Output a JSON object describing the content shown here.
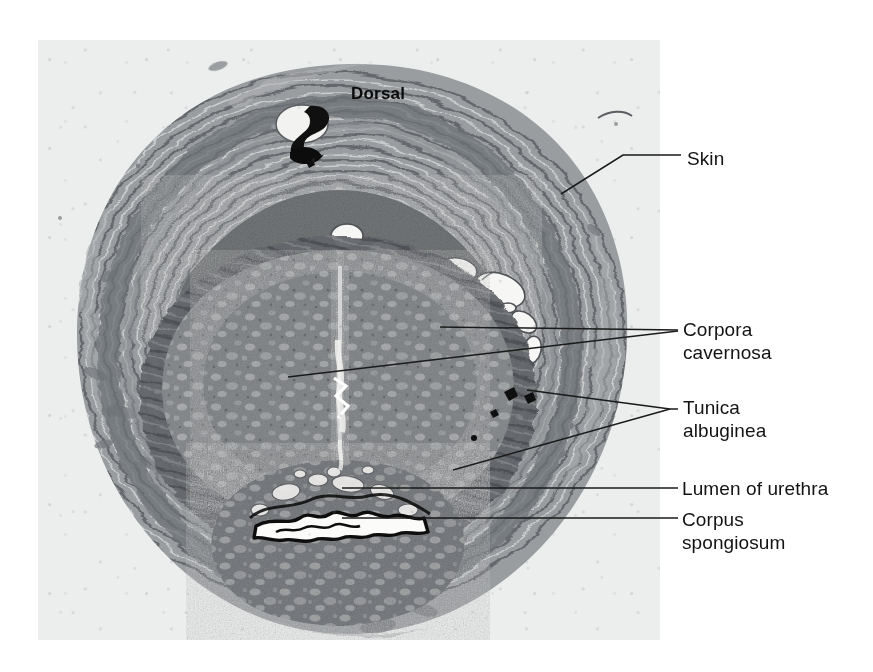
{
  "figure": {
    "kind": "light-micrograph",
    "panel_background": "#eceded"
  },
  "orientation": {
    "top_label": "Dorsal",
    "bottom_label": "Ventral"
  },
  "labels": [
    {
      "id": "skin",
      "text": "Skin",
      "leader": "bent",
      "points_to": "outer integument / dermis at upper right of section"
    },
    {
      "id": "corpora-cavernosa",
      "text": "Corpora\ncavernosa",
      "leader": "double",
      "points_to": "paired erectile bodies in the dorsal half of the section"
    },
    {
      "id": "tunica-albuginea",
      "text": "Tunica\nalbuginea",
      "leader": "forked",
      "points_to": "dense collagenous sheath enclosing the erectile bodies"
    },
    {
      "id": "lumen-of-urethra",
      "text": "Lumen of urethra",
      "leader": "straight",
      "points_to": "irregular slit-like channel within the corpus spongiosum"
    },
    {
      "id": "corpus-spongiosum",
      "text": "Corpus\nspongiosum",
      "leader": "straight",
      "points_to": "ventral erectile body surrounding the urethra"
    }
  ],
  "tissue_regions": [
    {
      "name": "skin-and-dartos",
      "tone": "#8e9194"
    },
    {
      "name": "deep-fascia",
      "tone": "#7c7f83"
    },
    {
      "name": "dorsal-neurovascular-bundle",
      "tone": "#6f7276"
    },
    {
      "name": "corpus-cavernosum-left",
      "tone": "#828588"
    },
    {
      "name": "corpus-cavernosum-right",
      "tone": "#828588"
    },
    {
      "name": "tunica-albuginea-sheath",
      "tone": "#5f6266"
    },
    {
      "name": "corpus-spongiosum",
      "tone": "#74777b"
    },
    {
      "name": "urethral-lumen",
      "tone": "#f4f4f2"
    },
    {
      "name": "dorsal-vein",
      "tone": "#141414"
    }
  ],
  "colors": {
    "ink": "#131313",
    "leader_line": "#1a1a1a",
    "plate": "#eceded",
    "page": "#ffffff"
  }
}
